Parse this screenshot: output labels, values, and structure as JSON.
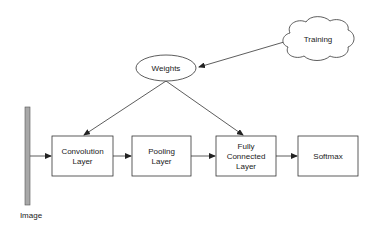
{
  "diagram": {
    "nodes": {
      "training": {
        "label": "Training",
        "shape": "cloud"
      },
      "weights": {
        "label": "Weights",
        "shape": "ellipse"
      },
      "image": {
        "label": "Image",
        "shape": "bar"
      },
      "convolution": {
        "line1": "Convolution",
        "line2": "Layer",
        "shape": "rect"
      },
      "pooling": {
        "line1": "Pooling",
        "line2": "Layer",
        "shape": "rect"
      },
      "fully_connected": {
        "line1": "Fully",
        "line2": "Connected",
        "line3": "Layer",
        "shape": "rect"
      },
      "softmax": {
        "label": "Softmax",
        "shape": "rect"
      }
    },
    "edges": [
      {
        "from": "training",
        "to": "weights"
      },
      {
        "from": "weights",
        "to": "convolution"
      },
      {
        "from": "weights",
        "to": "fully_connected"
      },
      {
        "from": "image",
        "to": "convolution"
      },
      {
        "from": "convolution",
        "to": "pooling"
      },
      {
        "from": "pooling",
        "to": "fully_connected"
      },
      {
        "from": "fully_connected",
        "to": "softmax"
      }
    ],
    "colors": {
      "stroke": "#333333",
      "image_bar_fill": "#a8a8a8",
      "text": "#1a1a1a"
    }
  }
}
